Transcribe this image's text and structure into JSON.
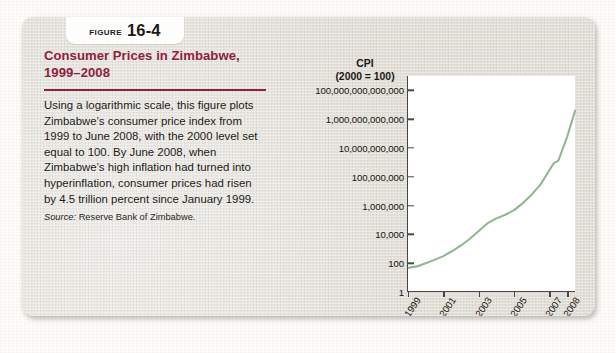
{
  "figure": {
    "badge": {
      "word": "Figure",
      "number": "16-4",
      "icon": "figure-badge"
    },
    "title": "Consumer Prices in Zimbabwe, 1999–2008",
    "body": "Using a logarithmic scale, this figure plots Zimbabwe’s consumer price index from 1999 to June 2008, with the 2000 level set equal to 100. By June 2008, when Zimbabwe’s high inflation had turned into hyperinflation, consumer prices had risen by 4.5 trillion percent since January 1999.",
    "source_label": "Source:",
    "source_text": "Reserve Bank of Zimbabwe.",
    "accent_color": "#8e2140",
    "card_color": "#e4e1da"
  },
  "chart_data": {
    "type": "line",
    "title": "Consumer Prices in Zimbabwe, 1999–2008",
    "ylabel": "CPI",
    "ylabel_note": "(2000 = 100)",
    "ylabel_line1": "CPI",
    "ylabel_line2": "(2000 = 100)",
    "xlabel": "Year",
    "grid": false,
    "legend": "none",
    "yscale": "log",
    "ylim": [
      1,
      1000000000000000
    ],
    "xlim": [
      1999,
      2008.5
    ],
    "ytick_labels": [
      "100,000,000,000,000",
      "1,000,000,000,000",
      "10,000,000,000",
      "100,000,000",
      "1,000,000",
      "10,000",
      "100",
      "1"
    ],
    "ytick_values": [
      100000000000000,
      1000000000000,
      10000000000,
      100000000,
      1000000,
      10000,
      100,
      1
    ],
    "xtick_labels": [
      "1999",
      "2001",
      "2003",
      "2005",
      "2007",
      "2008"
    ],
    "xtick_values": [
      1999,
      2001,
      2003,
      2005,
      2007,
      2008
    ],
    "series": [
      {
        "name": "Zimbabwe CPI (2000 = 100)",
        "color": "#8fb88f",
        "x": [
          1999.0,
          1999.5,
          2000.0,
          2000.5,
          2001.0,
          2001.5,
          2002.0,
          2002.5,
          2003.0,
          2003.5,
          2004.0,
          2004.5,
          2005.0,
          2005.5,
          2006.0,
          2006.5,
          2007.0,
          2007.25,
          2007.5,
          2008.0,
          2008.45
        ],
        "y": [
          47,
          60,
          100,
          170,
          310,
          700,
          1700,
          5000,
          17000,
          60000,
          130000,
          230000,
          480000,
          1500000,
          6000000,
          30000000,
          300000000,
          900000000,
          1300000000,
          60000000000,
          4000000000000
        ]
      }
    ],
    "annotation": "Consumer prices rose by 4.5 trillion percent between January 1999 and June 2008."
  }
}
